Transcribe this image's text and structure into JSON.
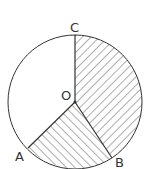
{
  "diagram": {
    "type": "circle-sectors",
    "center_label": "O",
    "points": [
      {
        "label": "C",
        "position": "top"
      },
      {
        "label": "A",
        "position": "lower-left"
      },
      {
        "label": "B",
        "position": "lower-right"
      }
    ],
    "shaded_sectors": [
      {
        "from": "C",
        "to": "B",
        "hatch": "diagonal-down"
      },
      {
        "from": "B",
        "to": "A",
        "hatch": "diagonal-up"
      }
    ],
    "unshaded_sector": {
      "from": "A",
      "to": "C"
    },
    "colors": {
      "stroke": "#333333",
      "background": "#ffffff"
    }
  }
}
